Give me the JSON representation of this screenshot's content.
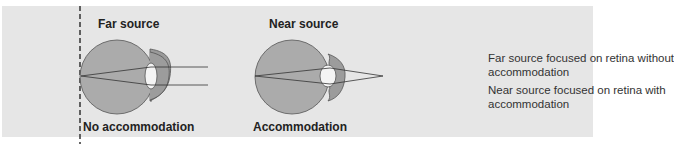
{
  "diagram": {
    "left": {
      "title": "Far source",
      "caption": "No accommodation"
    },
    "middle": {
      "title": "Near source",
      "caption": "Accommodation"
    },
    "legend": [
      {
        "line1": "Far source focused on retina without",
        "line2": "accommodation"
      },
      {
        "line1": "Near source focused on retina with",
        "line2": "accommodation"
      }
    ],
    "colors": {
      "background": "#e6e6e6",
      "eyeball": "#a8a8a8",
      "cornea": "#9a9a9a",
      "lens": "#f4f4f4",
      "line": "#333333"
    }
  }
}
